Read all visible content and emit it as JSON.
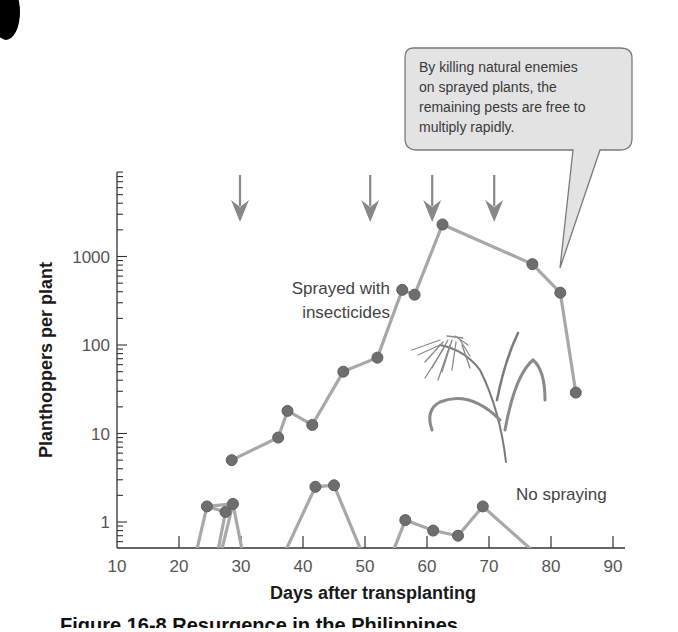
{
  "chart_data": {
    "type": "line",
    "title": "",
    "xlabel": "Days after transplanting",
    "ylabel": "Planthoppers per plant",
    "xlim": [
      10,
      90
    ],
    "ylim": [
      0.5,
      9000
    ],
    "yscale": "log",
    "x_ticks": [
      "10",
      "20",
      "30",
      "40",
      "50",
      "60",
      "70",
      "80",
      "90"
    ],
    "y_ticks": [
      "1",
      "10",
      "100",
      "1000"
    ],
    "grid": false,
    "series": [
      {
        "name": "Sprayed with insecticides",
        "label_lines": [
          "Sprayed with",
          "insecticides"
        ],
        "x": [
          28.5,
          36,
          37.5,
          41.5,
          46.5,
          52,
          56,
          58,
          62.5,
          77,
          81.5,
          84
        ],
        "values": [
          5,
          9,
          18,
          12.5,
          50,
          72,
          420,
          370,
          2300,
          820,
          390,
          29
        ]
      },
      {
        "name": "No spraying",
        "label_lines": [
          "No spraying"
        ],
        "x": [
          24.5,
          27.5,
          28.7,
          42,
          45,
          56.5,
          61,
          65,
          69
        ],
        "values": [
          1.5,
          1.3,
          1.6,
          2.5,
          2.6,
          1.05,
          0.8,
          0.7,
          1.5
        ]
      }
    ],
    "spray_arrows_x": [
      30,
      51,
      61,
      71
    ],
    "annotations": [
      {
        "type": "callout",
        "lines": [
          "By killing natural enemies",
          "on sprayed plants, the",
          "remaining pests are free to",
          "multiply rapidly."
        ]
      }
    ],
    "illustration": "rice-plant"
  },
  "caption": {
    "text": "Figure 16-8  Resurgence in the Philippines"
  }
}
